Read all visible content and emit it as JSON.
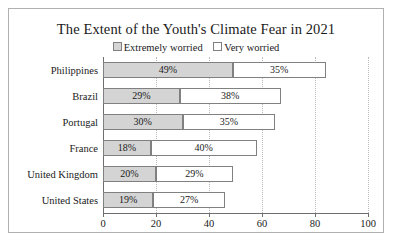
{
  "chart": {
    "title": "The Extent of the Youth's Climate Fear in 2021",
    "legend": [
      {
        "label": "Extremely worried",
        "swatch": "filled-gray-square"
      },
      {
        "label": "Very worried",
        "swatch": "empty-white-square"
      }
    ]
  },
  "chart_data": {
    "type": "bar",
    "orientation": "horizontal",
    "stacked": true,
    "title": "The Extent of the Youth's Climate Fear in 2021",
    "xlabel": "",
    "ylabel": "",
    "xlim": [
      0,
      100
    ],
    "xticks": [
      0,
      20,
      40,
      60,
      80,
      100
    ],
    "xticklabels": [
      "0",
      "20",
      "40",
      "60",
      "80",
      "100"
    ],
    "grid": "vertical-dotted",
    "legend_position": "top-center",
    "categories": [
      "Philippines",
      "Brazil",
      "Portugal",
      "France",
      "United Kingdom",
      "United States"
    ],
    "series": [
      {
        "name": "Extremely worried",
        "color": "#d4d4d4",
        "values": [
          49,
          29,
          30,
          18,
          20,
          19
        ],
        "labels": [
          "49%",
          "29%",
          "30%",
          "18%",
          "20%",
          "19%"
        ]
      },
      {
        "name": "Very worried",
        "color": "#ffffff",
        "values": [
          35,
          38,
          35,
          40,
          29,
          27
        ],
        "labels": [
          "35%",
          "38%",
          "35%",
          "40%",
          "29%",
          "27%"
        ]
      }
    ],
    "totals": [
      84,
      67,
      65,
      58,
      49,
      46
    ]
  }
}
